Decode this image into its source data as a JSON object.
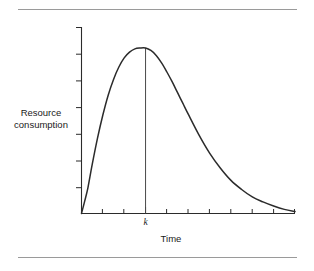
{
  "figure": {
    "background_color": "#ffffff",
    "line_color": "#2b2b2b",
    "rule_color": "#9a9a9a",
    "y_axis_label_line1": "Resource",
    "y_axis_label_line2": "consumption",
    "x_axis_label": "Time",
    "peak_marker_label": "k"
  },
  "chart_data": {
    "type": "line",
    "title": "",
    "subtitle": "",
    "xlabel": "Time",
    "ylabel": "Resource consumption",
    "grid": false,
    "legend": null,
    "annotations": [
      {
        "label": "k",
        "description": "vertical line dropped from curve peak to time axis",
        "x": 3.0,
        "y": 1.0
      }
    ],
    "axes": {
      "x": {
        "range": [
          0,
          10
        ],
        "tick_labels": [
          "",
          "",
          "",
          "k",
          "",
          "",
          "",
          "",
          "",
          "",
          ""
        ],
        "tick_values": [
          0,
          1,
          2,
          3,
          4,
          5,
          6,
          7,
          8,
          9,
          10
        ],
        "ticks_inward": true,
        "numeric_labels_shown": false
      },
      "y": {
        "range": [
          0,
          1.12
        ],
        "tick_labels": [
          "",
          "",
          "",
          "",
          "",
          "",
          "",
          ""
        ],
        "tick_values": [
          0.14,
          0.28,
          0.42,
          0.56,
          0.7,
          0.84,
          0.98,
          1.12
        ],
        "ticks_inward": true,
        "numeric_labels_shown": false
      }
    },
    "series": [
      {
        "name": "Resource consumption",
        "description": "Hubbert-style skewed peak curve rising steeply from the origin to a maximum at time k, then declining with a long right tail",
        "x": [
          0.0,
          0.15,
          0.3,
          0.5,
          0.75,
          1.0,
          1.25,
          1.5,
          1.75,
          2.0,
          2.25,
          2.5,
          2.75,
          3.0,
          3.25,
          3.5,
          3.75,
          4.0,
          4.25,
          4.5,
          4.75,
          5.0,
          5.5,
          6.0,
          6.5,
          7.0,
          7.5,
          8.0,
          8.5,
          9.0,
          9.5,
          10.0
        ],
        "y": [
          0.0,
          0.075,
          0.155,
          0.295,
          0.455,
          0.595,
          0.715,
          0.81,
          0.885,
          0.94,
          0.975,
          0.995,
          1.0,
          1.0,
          0.985,
          0.955,
          0.91,
          0.855,
          0.795,
          0.73,
          0.665,
          0.6,
          0.475,
          0.365,
          0.275,
          0.2,
          0.145,
          0.1,
          0.07,
          0.045,
          0.025,
          0.012
        ]
      }
    ]
  }
}
